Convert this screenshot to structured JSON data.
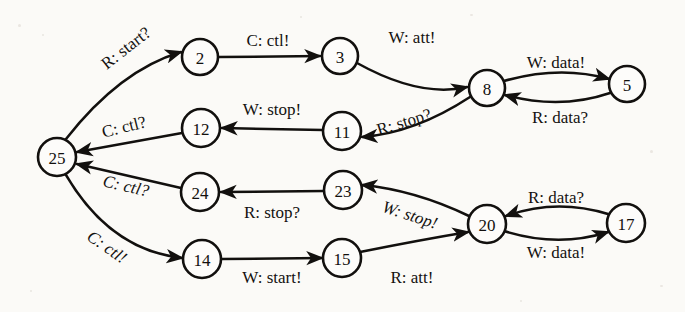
{
  "diagram": {
    "kind": "state-transition-diagram",
    "background_color": "#fbfaf7",
    "ink_color": "#12100e",
    "node_fill": "#fdfcfa",
    "nodes": [
      {
        "id": "n25",
        "label": "25",
        "cx": 57,
        "cy": 157,
        "r": 19
      },
      {
        "id": "n2",
        "label": "2",
        "cx": 200,
        "cy": 57,
        "r": 18
      },
      {
        "id": "n3",
        "label": "3",
        "cx": 340,
        "cy": 56,
        "r": 18
      },
      {
        "id": "n8",
        "label": "8",
        "cx": 487,
        "cy": 88,
        "r": 18
      },
      {
        "id": "n5",
        "label": "5",
        "cx": 627,
        "cy": 84,
        "r": 18
      },
      {
        "id": "n11",
        "label": "11",
        "cx": 342,
        "cy": 131,
        "r": 19
      },
      {
        "id": "n12",
        "label": "12",
        "cx": 201,
        "cy": 128,
        "r": 19
      },
      {
        "id": "n24",
        "label": "24",
        "cx": 200,
        "cy": 192,
        "r": 19
      },
      {
        "id": "n23",
        "label": "23",
        "cx": 343,
        "cy": 190,
        "r": 19
      },
      {
        "id": "n20",
        "label": "20",
        "cx": 487,
        "cy": 224,
        "r": 19
      },
      {
        "id": "n17",
        "label": "17",
        "cx": 626,
        "cy": 223,
        "r": 19
      },
      {
        "id": "n14",
        "label": "14",
        "cx": 202,
        "cy": 259,
        "r": 19
      },
      {
        "id": "n15",
        "label": "15",
        "cx": 342,
        "cy": 258,
        "r": 19
      }
    ],
    "edges": [
      {
        "id": "e1",
        "from": "n25",
        "to": "n2",
        "label": "R: start?",
        "label_x": 126,
        "label_y": 48,
        "label_rotate": -38,
        "label_italic": false
      },
      {
        "id": "e2",
        "from": "n2",
        "to": "n3",
        "label": "C: ctl!",
        "label_x": 268,
        "label_y": 40,
        "label_rotate": 0,
        "label_italic": false
      },
      {
        "id": "e3",
        "from": "n3",
        "to": "n8",
        "label": "W: att!",
        "label_x": 412,
        "label_y": 37,
        "label_rotate": 0,
        "label_italic": false
      },
      {
        "id": "e4",
        "from": "n8",
        "to": "n5",
        "label": "W: data!",
        "label_x": 556,
        "label_y": 62,
        "label_rotate": 0,
        "label_italic": false
      },
      {
        "id": "e5",
        "from": "n5",
        "to": "n8",
        "label": "R: data?",
        "label_x": 560,
        "label_y": 117,
        "label_rotate": 0,
        "label_italic": false
      },
      {
        "id": "e6",
        "from": "n8",
        "to": "n11",
        "label": "R: stop?",
        "label_x": 404,
        "label_y": 122,
        "label_rotate": -17,
        "label_italic": false
      },
      {
        "id": "e7",
        "from": "n11",
        "to": "n12",
        "label": "W: stop!",
        "label_x": 272,
        "label_y": 109,
        "label_rotate": 0,
        "label_italic": false
      },
      {
        "id": "e8",
        "from": "n12",
        "to": "n25",
        "label": "C: ctl?",
        "label_x": 124,
        "label_y": 127,
        "label_rotate": -14,
        "label_italic": false
      },
      {
        "id": "e9",
        "from": "n23",
        "to": "n24",
        "label": "R: stop?",
        "label_x": 272,
        "label_y": 212,
        "label_rotate": 0,
        "label_italic": false
      },
      {
        "id": "e10",
        "from": "n24",
        "to": "n25",
        "label": "C: ctl?",
        "label_x": 126,
        "label_y": 186,
        "label_rotate": 13,
        "label_italic": true
      },
      {
        "id": "e11",
        "from": "n20",
        "to": "n23",
        "label": "W: stop!",
        "label_x": 410,
        "label_y": 215,
        "label_rotate": 18,
        "label_italic": true
      },
      {
        "id": "e12",
        "from": "n20",
        "to": "n17",
        "label": "W: data!",
        "label_x": 556,
        "label_y": 252,
        "label_rotate": 0,
        "label_italic": false
      },
      {
        "id": "e13",
        "from": "n17",
        "to": "n20",
        "label": "R: data?",
        "label_x": 556,
        "label_y": 197,
        "label_rotate": 0,
        "label_italic": false
      },
      {
        "id": "e14",
        "from": "n25",
        "to": "n14",
        "label": "C: ctl!",
        "label_x": 107,
        "label_y": 247,
        "label_rotate": 35,
        "label_italic": true
      },
      {
        "id": "e15",
        "from": "n14",
        "to": "n15",
        "label": "W: start!",
        "label_x": 272,
        "label_y": 277,
        "label_rotate": 0,
        "label_italic": false
      },
      {
        "id": "e16",
        "from": "n15",
        "to": "n20",
        "label": "R: att!",
        "label_x": 412,
        "label_y": 277,
        "label_rotate": 0,
        "label_italic": false
      }
    ]
  }
}
